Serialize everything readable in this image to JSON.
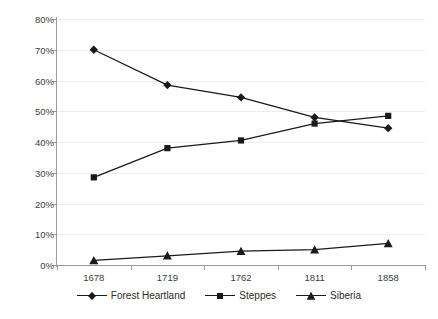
{
  "chart_data": {
    "type": "line",
    "title": "",
    "xlabel": "",
    "ylabel": "",
    "categories": [
      "1678",
      "1719",
      "1762",
      "1811",
      "1858"
    ],
    "ylim": [
      0,
      80
    ],
    "ytick_labels": [
      "0%",
      "10%",
      "20%",
      "30%",
      "40%",
      "50%",
      "60%",
      "70%",
      "80%"
    ],
    "ytick_values": [
      0,
      10,
      20,
      30,
      40,
      50,
      60,
      70,
      80
    ],
    "grid": "horizontal",
    "legend_position": "bottom",
    "series": [
      {
        "name": "Forest Heartland",
        "marker": "diamond",
        "color": "#1a1a1a",
        "values": [
          70,
          58.5,
          54.5,
          48,
          44.5
        ]
      },
      {
        "name": "Steppes",
        "marker": "square",
        "color": "#1a1a1a",
        "values": [
          28.5,
          38,
          40.5,
          46,
          48.5
        ]
      },
      {
        "name": "Siberia",
        "marker": "triangle",
        "color": "#1a1a1a",
        "values": [
          1.5,
          3,
          4.5,
          5,
          7
        ]
      }
    ]
  },
  "legend": {
    "items": [
      {
        "label": "Forest Heartland",
        "marker": "diamond"
      },
      {
        "label": "Steppes",
        "marker": "square"
      },
      {
        "label": "Siberia",
        "marker": "triangle"
      }
    ]
  }
}
